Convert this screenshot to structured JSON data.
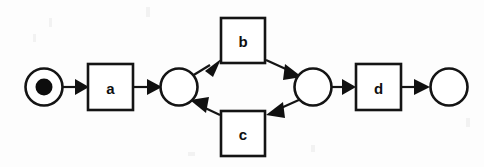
{
  "diagram": {
    "type": "petri-net",
    "background_color": "#fdfdfd",
    "stroke_color": "#141414",
    "fill_color": "#ffffff",
    "token_color": "#0d0d0d",
    "places": [
      {
        "id": "p-start",
        "name": "start-place",
        "label": "",
        "cx": 44,
        "cy": 87,
        "r": 18.5,
        "tokens": 1,
        "token_r": 8.5
      },
      {
        "id": "p-split",
        "name": "split-place",
        "label": "",
        "cx": 179,
        "cy": 87,
        "r": 18.5,
        "tokens": 0,
        "token_r": 0
      },
      {
        "id": "p-join",
        "name": "join-place",
        "label": "",
        "cx": 313,
        "cy": 87,
        "r": 18.5,
        "tokens": 0,
        "token_r": 0
      },
      {
        "id": "p-end",
        "name": "end-place",
        "label": "",
        "cx": 449,
        "cy": 87,
        "r": 18.5,
        "tokens": 0,
        "token_r": 0
      }
    ],
    "transitions": [
      {
        "id": "t-a",
        "name": "transition-a",
        "label": "a",
        "x": 88,
        "y": 64,
        "w": 45,
        "h": 46
      },
      {
        "id": "t-b",
        "name": "transition-b",
        "label": "b",
        "x": 221,
        "y": 18,
        "w": 44,
        "h": 45
      },
      {
        "id": "t-c",
        "name": "transition-c",
        "label": "c",
        "x": 221,
        "y": 111,
        "w": 44,
        "h": 45
      },
      {
        "id": "t-d",
        "name": "transition-d",
        "label": "d",
        "x": 356,
        "y": 64,
        "w": 45,
        "h": 46
      }
    ],
    "arcs": [
      {
        "id": "arc-start-a",
        "name": "arc-start-to-a",
        "from": "p-start",
        "to": "t-a",
        "x1": 63,
        "y1": 87,
        "x2": 87,
        "y2": 87
      },
      {
        "id": "arc-a-split",
        "name": "arc-a-to-split",
        "from": "t-a",
        "to": "p-split",
        "x1": 133,
        "y1": 87,
        "x2": 161,
        "y2": 87
      },
      {
        "id": "arc-split-b",
        "name": "arc-split-to-b",
        "from": "p-split",
        "to": "t-b",
        "x1": 192,
        "y1": 74,
        "x2": 220,
        "y2": 59
      },
      {
        "id": "arc-b-join",
        "name": "arc-b-to-join",
        "from": "t-b",
        "to": "p-join",
        "x1": 266,
        "y1": 59,
        "x2": 301,
        "y2": 76
      },
      {
        "id": "arc-join-c",
        "name": "arc-join-to-c",
        "from": "p-join",
        "to": "t-c",
        "x1": 301,
        "y1": 99,
        "x2": 267,
        "y2": 115
      },
      {
        "id": "arc-c-split",
        "name": "arc-c-to-split",
        "from": "t-c",
        "to": "p-split",
        "x1": 220,
        "y1": 115,
        "x2": 191,
        "y2": 100
      },
      {
        "id": "arc-join-d",
        "name": "arc-join-to-d",
        "from": "p-join",
        "to": "t-d",
        "x1": 332,
        "y1": 87,
        "x2": 355,
        "y2": 87
      },
      {
        "id": "arc-d-end",
        "name": "arc-d-to-end",
        "from": "t-d",
        "to": "p-end",
        "x1": 401,
        "y1": 87,
        "x2": 430,
        "y2": 87
      }
    ]
  }
}
